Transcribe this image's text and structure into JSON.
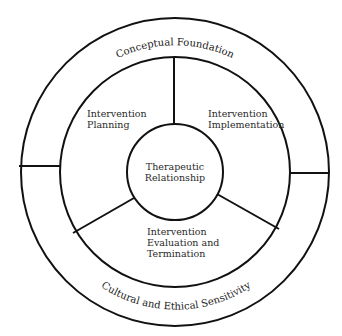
{
  "diagram": {
    "type": "concentric-circle-model",
    "outer_ring": {
      "top_label": "Conceptual Foundation",
      "bottom_label": "Cultural and Ethical Sensitivity"
    },
    "segments": [
      {
        "id": "planning",
        "lines": [
          "Intervention",
          "Planning"
        ]
      },
      {
        "id": "implementation",
        "lines": [
          "Intervention",
          "Implementation"
        ]
      },
      {
        "id": "evaluation",
        "lines": [
          "Intervention",
          "Evaluation and",
          "Termination"
        ]
      }
    ],
    "center": {
      "lines": [
        "Therapeutic",
        "Relationship"
      ]
    },
    "colors": {
      "stroke": "#111111",
      "background": "#ffffff",
      "text": "#2a2a2a"
    }
  }
}
